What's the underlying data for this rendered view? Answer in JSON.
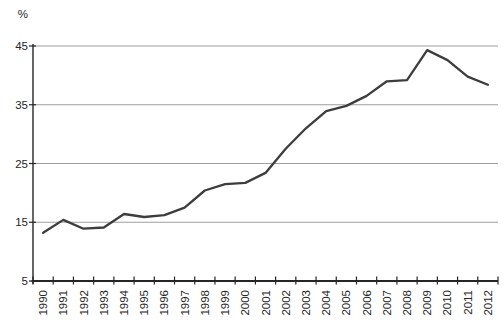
{
  "page": {
    "background": "#ffffff"
  },
  "chart_data": {
    "type": "line",
    "title": "",
    "subtitle": "",
    "ylabel": "%",
    "xlabel": "",
    "categories": [
      "1990",
      "1991",
      "1992",
      "1993",
      "1994",
      "1995",
      "1996",
      "1997",
      "1998",
      "1999",
      "2000",
      "2001",
      "2002",
      "2003",
      "2004",
      "2005",
      "2006",
      "2007",
      "2008",
      "2009",
      "2010",
      "2011",
      "2012"
    ],
    "series": [
      {
        "name": "percent-share",
        "values": [
          13.2,
          15.4,
          13.9,
          14.1,
          16.4,
          15.9,
          16.2,
          17.5,
          20.4,
          21.5,
          21.7,
          23.4,
          27.5,
          31.0,
          33.9,
          34.8,
          36.5,
          39.0,
          39.2,
          44.3,
          42.6,
          39.8,
          38.4
        ]
      }
    ],
    "ylim": [
      5,
      45
    ],
    "yticks": [
      5,
      15,
      25,
      35,
      45
    ],
    "grid": "horizontal-only",
    "legend": "none",
    "x_tick_style": "category-boundaries",
    "x_label_rotation_deg": -90,
    "colors": {
      "line": "#3d3d3d",
      "gridline": "#9e9e9e",
      "axis": "#262626",
      "text": "#262626",
      "background": "#ffffff"
    }
  }
}
